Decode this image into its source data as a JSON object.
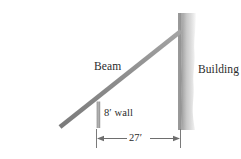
{
  "figure": {
    "type": "geometry-diagram",
    "labels": {
      "beam": "Beam",
      "building": "Building",
      "wall": "8′ wall",
      "dimension": "27′"
    },
    "measurements": {
      "wall_height": "8′",
      "ground_span": "27′"
    },
    "colors": {
      "beam": "#8c8c8c",
      "wall": "#a0a0a0",
      "building_edge": "#5a5a5a",
      "building_fill": "#d8d8d8",
      "ground": "#9a9a9a",
      "dimension": "#6e6e6e",
      "text": "#2b2b2b",
      "background": "#ffffff"
    },
    "geometry": {
      "beam_base_x": 60,
      "beam_base_y": 127,
      "beam_top_x": 181,
      "beam_top_y": 31,
      "wall_x": 98,
      "wall_top_y": 102,
      "ground_y": 127,
      "ground_left_x": 15,
      "ground_right_x": 193,
      "building_left_x": 179,
      "building_right_x": 196,
      "building_top_y": 13,
      "dimension_left_x": 96,
      "dimension_right_x": 180,
      "dimension_y": 139
    }
  }
}
